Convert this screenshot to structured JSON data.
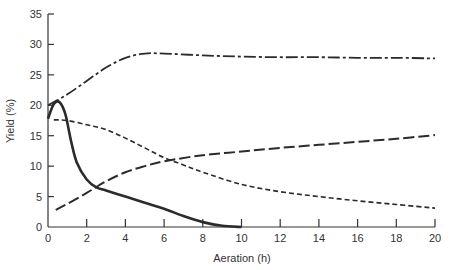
{
  "chart_data": {
    "type": "line",
    "title": "",
    "xlabel": "Aeration (h)",
    "ylabel": "Yield (%)",
    "xlim": [
      0,
      20
    ],
    "ylim": [
      0,
      35
    ],
    "xticks": [
      0,
      2,
      4,
      6,
      8,
      10,
      12,
      14,
      16,
      18,
      20
    ],
    "yticks": [
      0,
      5,
      10,
      15,
      20,
      25,
      30,
      35
    ],
    "grid": false,
    "legend": "none",
    "series": [
      {
        "name": "solid",
        "style": "solid",
        "points": [
          [
            0,
            17.8
          ],
          [
            0.3,
            20.2
          ],
          [
            0.6,
            20.5
          ],
          [
            0.9,
            18.5
          ],
          [
            1.2,
            14
          ],
          [
            1.5,
            10.5
          ],
          [
            2,
            7.8
          ],
          [
            2.5,
            6.5
          ],
          [
            3,
            6
          ],
          [
            4,
            5
          ],
          [
            5,
            4
          ],
          [
            6,
            3
          ],
          [
            7,
            1.8
          ],
          [
            8,
            0.8
          ],
          [
            9,
            0.2
          ],
          [
            10,
            0
          ]
        ]
      },
      {
        "name": "dash-dot",
        "style": "dashdot",
        "points": [
          [
            0,
            20
          ],
          [
            1,
            21.8
          ],
          [
            2,
            24
          ],
          [
            3,
            26.2
          ],
          [
            4,
            27.8
          ],
          [
            5,
            28.5
          ],
          [
            6,
            28.5
          ],
          [
            8,
            28.2
          ],
          [
            10,
            28
          ],
          [
            12,
            27.9
          ],
          [
            14,
            27.9
          ],
          [
            16,
            27.8
          ],
          [
            18,
            27.8
          ],
          [
            20,
            27.7
          ]
        ]
      },
      {
        "name": "short-dash",
        "style": "shortdash",
        "points": [
          [
            0.3,
            17.6
          ],
          [
            1,
            17.5
          ],
          [
            2,
            16.8
          ],
          [
            3,
            16
          ],
          [
            4,
            14.6
          ],
          [
            5,
            13
          ],
          [
            6,
            11.4
          ],
          [
            7,
            10.2
          ],
          [
            8,
            9
          ],
          [
            10,
            7
          ],
          [
            12,
            5.8
          ],
          [
            14,
            5
          ],
          [
            16,
            4.3
          ],
          [
            18,
            3.7
          ],
          [
            20,
            3.1
          ]
        ]
      },
      {
        "name": "long-dash",
        "style": "longdash",
        "points": [
          [
            0.4,
            2.8
          ],
          [
            1,
            3.8
          ],
          [
            2,
            5.6
          ],
          [
            3,
            7.5
          ],
          [
            4,
            9
          ],
          [
            5,
            10
          ],
          [
            6,
            10.8
          ],
          [
            8,
            11.8
          ],
          [
            10,
            12.4
          ],
          [
            12,
            13
          ],
          [
            14,
            13.5
          ],
          [
            16,
            14
          ],
          [
            18,
            14.5
          ],
          [
            20,
            15.1
          ]
        ]
      }
    ]
  }
}
